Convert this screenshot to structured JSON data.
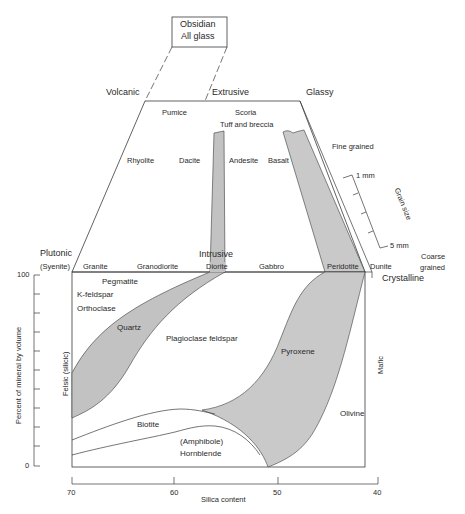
{
  "title_box": {
    "line1": "Obsidian",
    "line2": "All glass"
  },
  "volcanic_section": {
    "left_label": "Volcanic",
    "center_label": "Extrusive",
    "right_label": "Glassy",
    "textures": [
      "Pumice",
      "Scoria",
      "Tuff and breccia"
    ],
    "rocks": [
      "Rhyolite",
      "Dacite",
      "Andesite",
      "Basalt"
    ],
    "fine_label": "Fine grained"
  },
  "grain_scale": {
    "title": "Grain size",
    "top": "1 mm",
    "bottom": "5 mm",
    "coarse_line1": "Coarse",
    "coarse_line2": "grained"
  },
  "plutonic_section": {
    "left_label": "Plutonic",
    "syenite": "(Syenite)",
    "center_label": "Intrusive",
    "right_label": "Crystalline",
    "rocks": [
      "Granite",
      "Granodiorite",
      "Diorite",
      "Gabbro",
      "Peridotite",
      "Dunite"
    ]
  },
  "minerals": {
    "pegmatite": "Pegmatite",
    "kfeldspar": "K-feldspar",
    "orthoclase": "Orthoclase",
    "quartz": "Quartz",
    "plagioclase": "Plagioclase feldspar",
    "pyroxene": "Pyroxene",
    "biotite": "Biotite",
    "amphibole": "(Amphibole)",
    "hornblende": "Hornblende",
    "olivine": "Olivine"
  },
  "axes": {
    "y_label": "Percent of mineral by volume",
    "y_top": "100",
    "y_bottom": "0",
    "felsic": "Felsic (silicic)",
    "mafic": "Mafic",
    "x_label": "Silica content",
    "x_ticks": [
      "70",
      "60",
      "50",
      "40"
    ]
  },
  "colors": {
    "band_fill": "#c9c9c9",
    "line": "#3a3a3a",
    "text": "#2a2a2a"
  }
}
